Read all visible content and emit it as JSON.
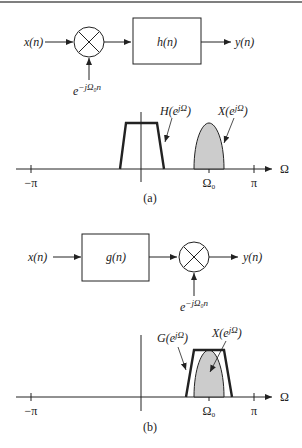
{
  "figure": {
    "top_rule": true,
    "panel_a": {
      "caption": "(a)",
      "block_diagram": {
        "input": "x(n)",
        "multiplier": "×",
        "modulator": "e",
        "modulator_exp": "−jΩ₀n",
        "filter": "h(n)",
        "output": "y(n)"
      },
      "spectrum": {
        "filter_label": "H(e",
        "filter_label_exp": "jΩ",
        "filter_label_end": ")",
        "signal_label": "X(e",
        "signal_label_exp": "jΩ",
        "signal_label_end": ")",
        "axis_label": "Ω",
        "ticks": [
          "−π",
          "Ω₀",
          "π"
        ]
      }
    },
    "panel_b": {
      "caption": "(b)",
      "block_diagram": {
        "input": "x(n)",
        "filter": "g(n)",
        "multiplier": "×",
        "modulator": "e",
        "modulator_exp": "−jΩ₀n",
        "output": "y(n)"
      },
      "spectrum": {
        "filter_label": "G(e",
        "filter_label_exp": "jΩ",
        "filter_label_end": ")",
        "signal_label": "X(e",
        "signal_label_exp": "jΩ",
        "signal_label_end": ")",
        "axis_label": "Ω",
        "ticks": [
          "−π",
          "Ω₀",
          "π"
        ]
      }
    },
    "colors": {
      "line": "#222222",
      "fill": "#cccccc",
      "rule": "#555555"
    }
  }
}
